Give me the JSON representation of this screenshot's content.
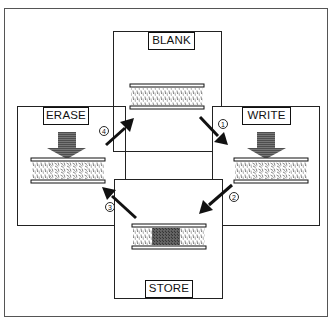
{
  "diagram": {
    "type": "cycle",
    "stages": [
      {
        "id": "blank",
        "label": "BLANK",
        "layer_state": "uniform"
      },
      {
        "id": "write",
        "label": "WRITE",
        "layer_state": "written",
        "has_down_arrow": true
      },
      {
        "id": "store",
        "label": "STORE",
        "layer_state": "stored"
      },
      {
        "id": "erase",
        "label": "ERASE",
        "layer_state": "written",
        "has_down_arrow": true
      }
    ],
    "transitions": [
      {
        "step": "1",
        "from": "BLANK",
        "to": "WRITE"
      },
      {
        "step": "2",
        "from": "WRITE",
        "to": "STORE"
      },
      {
        "step": "3",
        "from": "STORE",
        "to": "ERASE"
      },
      {
        "step": "4",
        "from": "ERASE",
        "to": "BLANK"
      }
    ]
  },
  "colors": {
    "line": "#111111",
    "frame": "#555555",
    "arrow_fill": "#555555",
    "stored_region": "#444444"
  }
}
